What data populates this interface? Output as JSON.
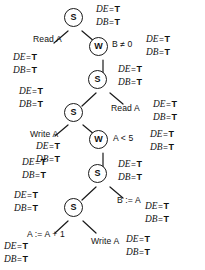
{
  "diagram": {
    "stroke_color": "#1a1a1a",
    "background_color": "#ffffff",
    "node_labels": {
      "statement": "S",
      "while": "W"
    },
    "annotation_tokens": {
      "de": "DE",
      "db": "DB",
      "eq": "=",
      "t": "T"
    },
    "nodes": [
      {
        "id": "s1",
        "type": "statement",
        "label": "S",
        "x": 73,
        "y": 17
      },
      {
        "id": "w1",
        "type": "while",
        "label": "W",
        "x": 98,
        "y": 46
      },
      {
        "id": "s2",
        "type": "statement",
        "label": "S",
        "x": 97,
        "y": 79
      },
      {
        "id": "s3",
        "type": "statement",
        "label": "S",
        "x": 73,
        "y": 112
      },
      {
        "id": "w2",
        "type": "while",
        "label": "W",
        "x": 98,
        "y": 139
      },
      {
        "id": "s4",
        "type": "statement",
        "label": "S",
        "x": 97,
        "y": 173
      },
      {
        "id": "s5",
        "type": "statement",
        "label": "S",
        "x": 73,
        "y": 207
      }
    ],
    "edge_labels": [
      {
        "id": "read-a-1",
        "text": "Read A",
        "x": 33,
        "y": 34
      },
      {
        "id": "b-ne-0",
        "text": "B ≠ 0",
        "x": 112,
        "y": 39
      },
      {
        "id": "read-a-2",
        "text": "Read A",
        "x": 111,
        "y": 103
      },
      {
        "id": "write-a-1",
        "text": "Write A",
        "x": 30,
        "y": 129
      },
      {
        "id": "a-lt-5",
        "text": "A < 5",
        "x": 113,
        "y": 133
      },
      {
        "id": "b-assign-a",
        "text": "B := A",
        "x": 117,
        "y": 195
      },
      {
        "id": "a-assign",
        "text": "A := A + 1",
        "x": 27,
        "y": 229
      },
      {
        "id": "write-a-2",
        "text": "Write A",
        "x": 91,
        "y": 236
      }
    ],
    "annotations": [
      {
        "id": "ann-1",
        "de": "DE = T",
        "db": "DB = T",
        "x": 96,
        "y": 3
      },
      {
        "id": "ann-2",
        "de": "DE = T",
        "db": "DB = T",
        "x": 146,
        "y": 33
      },
      {
        "id": "ann-3",
        "de": "DE = T",
        "db": "DB = T",
        "x": 13,
        "y": 51
      },
      {
        "id": "ann-4",
        "de": "DE = T",
        "db": "DB = T",
        "x": 118,
        "y": 63
      },
      {
        "id": "ann-5",
        "de": "DE = T",
        "db": "DB = T",
        "x": 19,
        "y": 85
      },
      {
        "id": "ann-6",
        "de": "DE = T",
        "db": "DB = T",
        "x": 153,
        "y": 98
      },
      {
        "id": "ann-7",
        "de": "DE = T",
        "db": "DB = T",
        "x": 36,
        "y": 140
      },
      {
        "id": "ann-8",
        "de": "DE = T",
        "db": "DB = T",
        "x": 150,
        "y": 128
      },
      {
        "id": "ann-9",
        "de": "DE = T",
        "db": "DB = T",
        "x": 22,
        "y": 156
      },
      {
        "id": "ann-10",
        "de": "DE = T",
        "db": "DB = T",
        "x": 118,
        "y": 158
      },
      {
        "id": "ann-11",
        "de": "DE = T",
        "db": "DB = T",
        "x": 145,
        "y": 200
      },
      {
        "id": "ann-12",
        "de": "DE = T",
        "db": "DB = T",
        "x": 14,
        "y": 189
      },
      {
        "id": "ann-13",
        "de": "DE = T",
        "db": "DB = T",
        "x": 126,
        "y": 233
      },
      {
        "id": "ann-14",
        "de": "DE = T",
        "db": "DB = T",
        "x": 4,
        "y": 240
      }
    ],
    "edges": [
      {
        "from": "s1",
        "to": "read-a-1",
        "x1": 68,
        "y1": 31,
        "x2": 54,
        "y2": 43
      },
      {
        "from": "s1",
        "to": "w1",
        "x1": 82,
        "y1": 31,
        "x2": 95,
        "y2": 42
      },
      {
        "from": "w1",
        "to": "s2",
        "x1": 103,
        "y1": 60,
        "x2": 103,
        "y2": 74
      },
      {
        "from": "s2",
        "to": "s3",
        "x1": 96,
        "y1": 93,
        "x2": 82,
        "y2": 106
      },
      {
        "from": "s2",
        "to": "read-a-2",
        "x1": 110,
        "y1": 93,
        "x2": 123,
        "y2": 104
      },
      {
        "from": "s3",
        "to": "write-a",
        "x1": 68,
        "y1": 125,
        "x2": 55,
        "y2": 136
      },
      {
        "from": "s3",
        "to": "w2",
        "x1": 83,
        "y1": 125,
        "x2": 95,
        "y2": 135
      },
      {
        "from": "w2",
        "to": "s4",
        "x1": 103,
        "y1": 153,
        "x2": 103,
        "y2": 168
      },
      {
        "from": "s4",
        "to": "s5",
        "x1": 96,
        "y1": 187,
        "x2": 82,
        "y2": 200
      },
      {
        "from": "s4",
        "to": "b-assign",
        "x1": 110,
        "y1": 187,
        "x2": 123,
        "y2": 198
      },
      {
        "from": "s5",
        "to": "a-assign",
        "x1": 68,
        "y1": 221,
        "x2": 55,
        "y2": 233
      },
      {
        "from": "s5",
        "to": "write-a2",
        "x1": 83,
        "y1": 221,
        "x2": 96,
        "y2": 233
      }
    ]
  }
}
